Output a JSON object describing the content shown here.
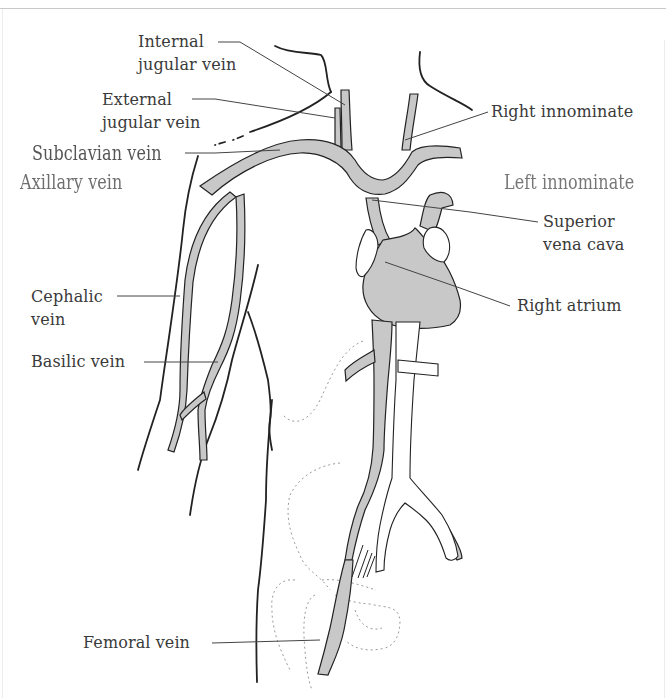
{
  "diagram": {
    "colors": {
      "vein_fill": "#c8c8c8",
      "outline": "#222222",
      "leader_line": "#444444",
      "bone_dotted": "#9a9a9a",
      "label_text": "#3a3a3a"
    },
    "labels": {
      "internal_jugular": {
        "line1": "Internal",
        "line2": "jugular vein"
      },
      "external_jugular": {
        "line1": "External",
        "line2": "jugular vein"
      },
      "subclavian": "Subclavian vein",
      "axillary": "Axillary vein",
      "right_innominate": "Right innominate",
      "left_innominate": "Left innominate",
      "superior_vena_cava": {
        "line1": "Superior",
        "line2": "vena cava"
      },
      "right_atrium": "Right atrium",
      "cephalic": {
        "line1": "Cephalic",
        "line2": "vein"
      },
      "basilic": "Basilic vein",
      "femoral": "Femoral vein"
    }
  }
}
